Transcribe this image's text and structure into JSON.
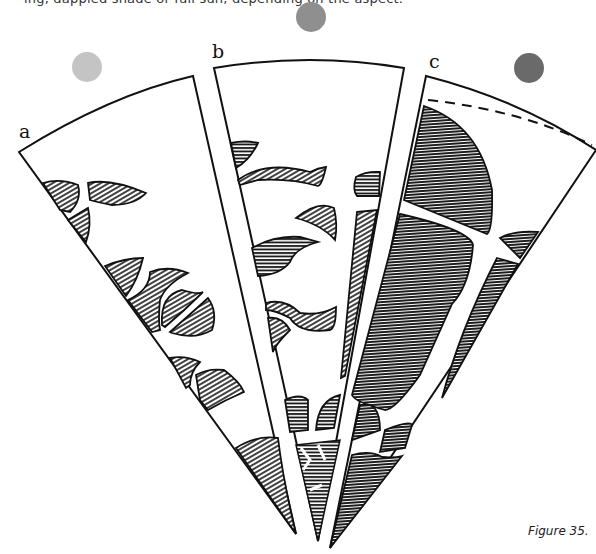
{
  "header": {
    "cut_off_text": "ing, dappled shade or full sun, depending on the aspect."
  },
  "figure": {
    "caption": "Figure 35.",
    "panels": [
      {
        "label": "a",
        "circle_color": "#c4c4c4",
        "description": "wedge with scattered hatched leaf shapes along left edge"
      },
      {
        "label": "b",
        "circle_color": "#8f8f8f",
        "description": "wedge with wavy hatched branch shapes"
      },
      {
        "label": "c",
        "circle_color": "#6a6a6a",
        "description": "wedge with large hatched canopy block and dashed upper boundary"
      }
    ],
    "colors": {
      "ink": "#111111",
      "paper": "#ffffff"
    }
  }
}
